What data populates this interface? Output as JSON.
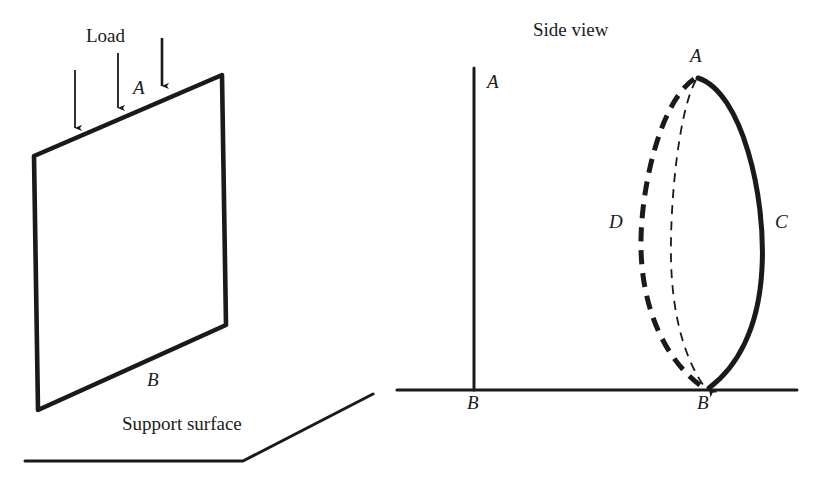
{
  "figure": {
    "background_color": "#ffffff",
    "ink_color": "#1a1a1a",
    "width": 820,
    "height": 486
  },
  "left_panel": {
    "name": "plate-under-load-perspective",
    "labels": {
      "load": "Load",
      "top_edge": "A",
      "bottom_edge": "B",
      "support_surface": "Support surface"
    },
    "plate": {
      "shape": "parallelogram",
      "corners": [
        [
          222,
          75
        ],
        [
          34,
          156
        ],
        [
          38,
          410
        ],
        [
          226,
          325
        ]
      ],
      "stroke_width": 4
    },
    "load_arrows": [
      {
        "x": 75,
        "y_start": 70,
        "y_end": 133
      },
      {
        "x": 118,
        "y_start": 53,
        "y_end": 113
      },
      {
        "x": 162,
        "y_start": 38,
        "y_end": 92
      }
    ],
    "support_surface_path": [
      [
        25,
        461
      ],
      [
        243,
        461
      ],
      [
        373,
        394
      ]
    ]
  },
  "right_panel": {
    "name": "side-view-buckling",
    "title": "Side view",
    "labels": {
      "straight_top": "A",
      "straight_bottom": "B",
      "buckled_top": "A",
      "buckled_bottom": "B",
      "right_curve": "C",
      "left_curve": "D"
    },
    "ground_line": {
      "x_start": 397,
      "x_end": 797,
      "y": 390
    },
    "straight_member": {
      "x": 474,
      "y_top": 68,
      "y_bottom": 390
    },
    "curves": [
      {
        "id": "C",
        "style": "solid-thick",
        "description": "buckled shape bulging right",
        "stroke_width": 5,
        "dash": "none",
        "path": "M 698 78 C 742 92, 766 196, 762 268 C 759 330, 736 368, 708 390"
      },
      {
        "id": "D",
        "style": "dashed-thick",
        "description": "buckled shape bulging left",
        "stroke_width": 5,
        "dash": "14 9",
        "path": "M 694 79 C 660 102, 640 190, 641 248 C 642 310, 666 362, 706 390"
      },
      {
        "id": "center",
        "style": "dashed-thin",
        "description": "slightly buckled intermediate shape",
        "stroke_width": 2,
        "dash": "9 7",
        "path": "M 696 80 C 679 110, 670 200, 671 258 C 672 318, 686 362, 707 390"
      }
    ]
  }
}
